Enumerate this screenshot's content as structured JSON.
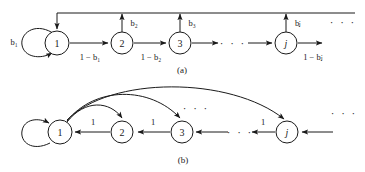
{
  "figure": {
    "type": "state-transition-diagram",
    "background_color": "#ffffff",
    "stroke_color": "#1a1a1a",
    "panels": [
      {
        "id": "a",
        "caption": "(a)",
        "description": "Markov chain with forward chain transitions and feedback arrows to state 1",
        "nodes": [
          {
            "id": "n1",
            "label": "1",
            "x": 57,
            "y": 43,
            "r": 12
          },
          {
            "id": "n2",
            "label": "2",
            "x": 122,
            "y": 43,
            "r": 11
          },
          {
            "id": "n3",
            "label": "3",
            "x": 180,
            "y": 43,
            "r": 11
          },
          {
            "id": "nj",
            "label": "j",
            "x": 286,
            "y": 43,
            "r": 11
          }
        ],
        "self_loop_label": "b₁",
        "up_labels": [
          "b₂",
          "b₃",
          "bⱼ"
        ],
        "forward_labels": [
          "1 − b₁",
          "1 − b₂",
          "1 − bⱼ"
        ],
        "ellipsis": [
          "· · ·",
          "· · ·"
        ]
      },
      {
        "id": "b",
        "caption": "(b)",
        "description": "Reversed chain with unit-probability backward transitions and return arcs from state 1",
        "nodes": [
          {
            "id": "m1",
            "label": "1",
            "x": 60,
            "y": 132,
            "r": 12
          },
          {
            "id": "m2",
            "label": "2",
            "x": 122,
            "y": 132,
            "r": 11
          },
          {
            "id": "m3",
            "label": "3",
            "x": 182,
            "y": 132,
            "r": 11
          },
          {
            "id": "mj",
            "label": "j",
            "x": 287,
            "y": 132,
            "r": 11
          }
        ],
        "backward_labels": [
          "1",
          "1",
          "1"
        ],
        "ellipsis": [
          "· · ·",
          "· · ·",
          "· · ·"
        ]
      }
    ],
    "labels": {
      "b1": "b₁",
      "b2": "b₂",
      "b3": "b₃",
      "bj": "bⱼ",
      "one_minus_b1": "1 − b₁",
      "one_minus_b2": "1 − b₂",
      "one_minus_bj": "1 − bⱼ",
      "one": "1",
      "node1": "1",
      "node2": "2",
      "node3": "3",
      "nodej": "j",
      "caption_a": "(a)",
      "caption_b": "(b)",
      "dots": "· · ·"
    }
  }
}
